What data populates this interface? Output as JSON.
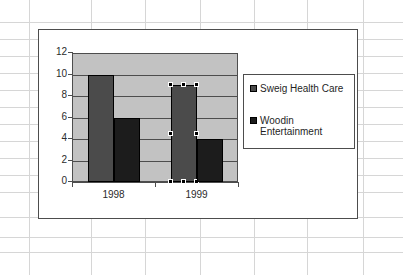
{
  "app": {
    "kind": "spreadsheet-embedded-chart",
    "background": "#ffffff",
    "gridline_color": "#d6d6d6"
  },
  "sheet": {
    "vertical_gridlines_x": [
      29,
      91,
      145,
      200,
      254,
      307,
      363
    ],
    "horizontal_gridlines_y": [
      22,
      39,
      56,
      73,
      90,
      107,
      124,
      141,
      158,
      175,
      192,
      217,
      237,
      252
    ]
  },
  "chart_object": {
    "selected": true,
    "frame_color": "#4d4d4d",
    "plot_background": "#c2c2c2"
  },
  "selection": {
    "series_selected": "Sweig Health Care",
    "point_selected": "1999",
    "handle_color": "#000000",
    "handle_count": 8
  },
  "legend": {
    "position": "right",
    "entries": [
      {
        "label": "Sweig Health Care",
        "color": "#4b4b4b",
        "swatch": "legend-swatch-sweig"
      },
      {
        "label": "Woodin\nEntertainment",
        "color": "#1c1c1c",
        "swatch": "legend-swatch-woodin"
      }
    ]
  },
  "chart_data": {
    "type": "bar",
    "title": "",
    "subtitle": "",
    "xlabel": "",
    "ylabel": "",
    "categories": [
      "1998",
      "1999"
    ],
    "series": [
      {
        "name": "Sweig Health Care",
        "color": "#4b4b4b",
        "values": [
          10,
          9
        ]
      },
      {
        "name": "Woodin Entertainment",
        "color": "#1c1c1c",
        "values": [
          6,
          4
        ]
      }
    ],
    "ylim": [
      0,
      12
    ],
    "yticks": [
      0,
      2,
      4,
      6,
      8,
      10,
      12
    ],
    "ytick_labels": [
      "0",
      "2",
      "4",
      "6",
      "8",
      "10",
      "12"
    ],
    "grid": true,
    "grid_axis": "y",
    "legend_position": "right",
    "bar_gap": "none"
  }
}
